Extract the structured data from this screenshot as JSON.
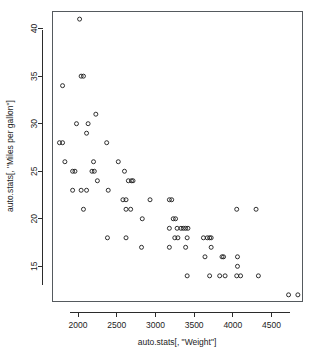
{
  "chart_data": {
    "type": "scatter",
    "title": "",
    "subtitle": "",
    "xlabel": "auto.stats[, \"Weight\"]",
    "ylabel": "auto.stats[, \"Miles per gallon\"]",
    "xlim": [
      1670,
      4900
    ],
    "ylim": [
      11.3,
      41.8
    ],
    "xticks": [
      2000,
      2500,
      3000,
      3500,
      4000,
      4500
    ],
    "yticks": [
      15,
      20,
      25,
      30,
      35,
      40
    ],
    "grid": false,
    "legend": null,
    "marker": "open-circle",
    "marker_color": "#1a1a1a",
    "marker_size": 4,
    "frame_color": "#555a5e",
    "background": "#ffffff",
    "n_points": 74,
    "points": [
      {
        "x": 2020,
        "y": 41
      },
      {
        "x": 2040,
        "y": 35
      },
      {
        "x": 2070,
        "y": 35
      },
      {
        "x": 1800,
        "y": 34
      },
      {
        "x": 2230,
        "y": 31
      },
      {
        "x": 1980,
        "y": 30
      },
      {
        "x": 2130,
        "y": 30
      },
      {
        "x": 2110,
        "y": 29
      },
      {
        "x": 1760,
        "y": 28
      },
      {
        "x": 1800,
        "y": 28
      },
      {
        "x": 2370,
        "y": 28
      },
      {
        "x": 1830,
        "y": 26
      },
      {
        "x": 2200,
        "y": 26
      },
      {
        "x": 2520,
        "y": 26
      },
      {
        "x": 1930,
        "y": 25
      },
      {
        "x": 1960,
        "y": 25
      },
      {
        "x": 2180,
        "y": 25
      },
      {
        "x": 2210,
        "y": 25
      },
      {
        "x": 2600,
        "y": 25
      },
      {
        "x": 2250,
        "y": 24
      },
      {
        "x": 2650,
        "y": 24
      },
      {
        "x": 2690,
        "y": 24
      },
      {
        "x": 2710,
        "y": 24
      },
      {
        "x": 1930,
        "y": 23
      },
      {
        "x": 2040,
        "y": 23
      },
      {
        "x": 2110,
        "y": 23
      },
      {
        "x": 2390,
        "y": 23
      },
      {
        "x": 2580,
        "y": 22
      },
      {
        "x": 2620,
        "y": 22
      },
      {
        "x": 2930,
        "y": 22
      },
      {
        "x": 3180,
        "y": 22
      },
      {
        "x": 3210,
        "y": 22
      },
      {
        "x": 2070,
        "y": 21
      },
      {
        "x": 2620,
        "y": 21
      },
      {
        "x": 2680,
        "y": 21
      },
      {
        "x": 4050,
        "y": 21
      },
      {
        "x": 4300,
        "y": 21
      },
      {
        "x": 3230,
        "y": 20
      },
      {
        "x": 3260,
        "y": 20
      },
      {
        "x": 2830,
        "y": 20
      },
      {
        "x": 3180,
        "y": 19
      },
      {
        "x": 3280,
        "y": 19
      },
      {
        "x": 3330,
        "y": 19
      },
      {
        "x": 3360,
        "y": 19
      },
      {
        "x": 3390,
        "y": 19
      },
      {
        "x": 3420,
        "y": 19
      },
      {
        "x": 2380,
        "y": 18
      },
      {
        "x": 2620,
        "y": 18
      },
      {
        "x": 3250,
        "y": 18
      },
      {
        "x": 3290,
        "y": 18
      },
      {
        "x": 3410,
        "y": 18
      },
      {
        "x": 3620,
        "y": 18
      },
      {
        "x": 3670,
        "y": 18
      },
      {
        "x": 3700,
        "y": 18
      },
      {
        "x": 3720,
        "y": 18
      },
      {
        "x": 2820,
        "y": 17
      },
      {
        "x": 3180,
        "y": 17
      },
      {
        "x": 3390,
        "y": 17
      },
      {
        "x": 3720,
        "y": 17
      },
      {
        "x": 3640,
        "y": 16
      },
      {
        "x": 3860,
        "y": 16
      },
      {
        "x": 3880,
        "y": 16
      },
      {
        "x": 4060,
        "y": 16
      },
      {
        "x": 4060,
        "y": 15
      },
      {
        "x": 3410,
        "y": 14
      },
      {
        "x": 3700,
        "y": 14
      },
      {
        "x": 3830,
        "y": 14
      },
      {
        "x": 3900,
        "y": 14
      },
      {
        "x": 4050,
        "y": 14
      },
      {
        "x": 4100,
        "y": 14
      },
      {
        "x": 4330,
        "y": 14
      },
      {
        "x": 4720,
        "y": 12
      },
      {
        "x": 4840,
        "y": 12
      }
    ]
  }
}
